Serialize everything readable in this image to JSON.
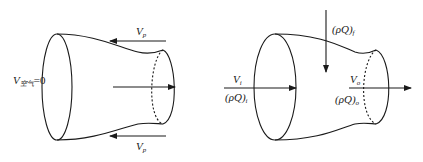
{
  "diagram": {
    "type": "control-volume sketch",
    "left_figure": {
      "description": "Stationary engine duct (control volume) with incoming relative flow",
      "labels": {
        "v_air": {
          "symbol": "V",
          "subscript": "空气",
          "suffix": "=0"
        },
        "vp_top": {
          "symbol": "V",
          "subscript": "p"
        },
        "vp_bottom": {
          "symbol": "V",
          "subscript": "p"
        }
      },
      "arrows": [
        {
          "id": "vp-top-arrow",
          "direction": "left"
        },
        {
          "id": "vp-bottom-arrow",
          "direction": "left"
        },
        {
          "id": "internal-flow-arrow",
          "direction": "right"
        }
      ]
    },
    "right_figure": {
      "description": "Engine control volume with inlet, fuel and outlet mass flows",
      "labels": {
        "v_in": {
          "symbol": "V",
          "subscript": "i"
        },
        "mass_in": {
          "symbol": "(ρQ)",
          "subscript": "i"
        },
        "mass_fuel": {
          "symbol": "(ρQ)",
          "subscript": "f"
        },
        "v_out": {
          "symbol": "V",
          "subscript": "o"
        },
        "mass_out": {
          "symbol": "(ρQ)",
          "subscript": "o"
        }
      },
      "arrows": [
        {
          "id": "inlet-arrow",
          "direction": "right"
        },
        {
          "id": "fuel-arrow",
          "direction": "down"
        },
        {
          "id": "outlet-arrow",
          "direction": "right"
        }
      ]
    }
  }
}
